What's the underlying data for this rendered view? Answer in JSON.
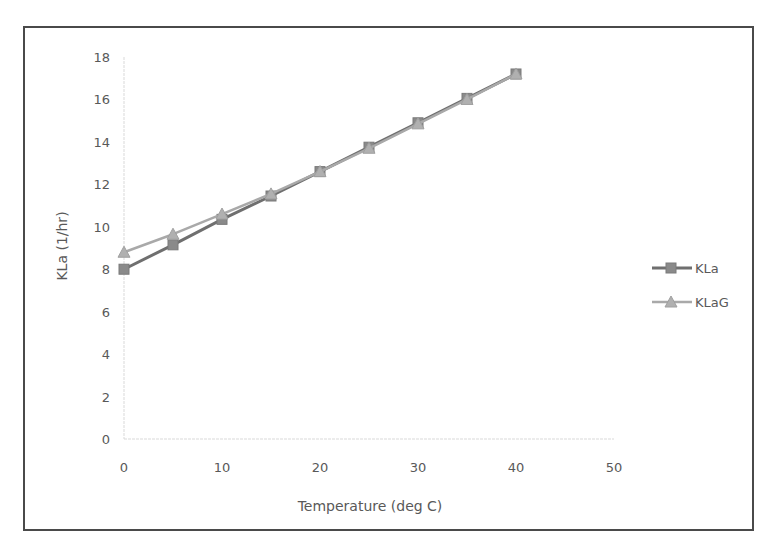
{
  "chart_data": {
    "type": "line",
    "title": "",
    "xlabel": "Temperature (deg C)",
    "ylabel": "KLa (1/hr)",
    "xlim": [
      0,
      50
    ],
    "ylim": [
      0,
      18
    ],
    "xticks": [
      0,
      10,
      20,
      30,
      40,
      50
    ],
    "yticks": [
      0,
      2,
      4,
      6,
      8,
      10,
      12,
      14,
      16,
      18
    ],
    "grid": false,
    "legend_position": "right",
    "x": [
      0,
      5,
      10,
      15,
      20,
      25,
      30,
      35,
      40
    ],
    "series": [
      {
        "name": "KLa",
        "marker": "square",
        "color": "#6f6f6f",
        "marker_color": "#8a8a8a",
        "values": [
          8.0,
          9.15,
          10.35,
          11.45,
          12.6,
          13.75,
          14.9,
          16.05,
          17.2
        ]
      },
      {
        "name": "KLaG",
        "marker": "triangle",
        "color": "#a9a9a9",
        "marker_color": "#b0b0b0",
        "values": [
          8.8,
          9.65,
          10.6,
          11.55,
          12.6,
          13.7,
          14.85,
          16.0,
          17.2
        ]
      }
    ]
  }
}
